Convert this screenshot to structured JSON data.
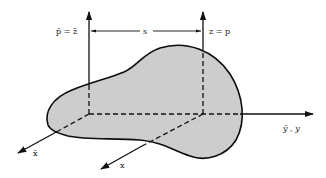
{
  "figure": {
    "colors": {
      "background": "#ffffff",
      "region_fill": "#c9c9c9",
      "line": "#111111"
    }
  },
  "labels": {
    "centroidal_vertical": "p̄ = z̄",
    "shifted_vertical": "z = p",
    "offset_distance": "s",
    "common_horizontal": "ȳ , y",
    "centroidal_depth": "x̄",
    "shifted_depth": "x"
  },
  "axes": [
    {
      "name": "p-bar/z-bar",
      "direction": "vertical",
      "origin": [
        89,
        114
      ],
      "tip": [
        89,
        12
      ]
    },
    {
      "name": "z/p",
      "direction": "vertical",
      "origin": [
        203,
        114
      ],
      "tip": [
        203,
        12
      ]
    },
    {
      "name": "y-bar/y",
      "direction": "horizontal",
      "origin": [
        89,
        114
      ],
      "tip": [
        313,
        114
      ]
    },
    {
      "name": "x-bar",
      "direction": "oblique",
      "origin": [
        89,
        114
      ],
      "tip": [
        18,
        153
      ]
    },
    {
      "name": "x",
      "direction": "oblique",
      "origin": [
        203,
        114
      ],
      "tip": [
        101,
        169
      ]
    }
  ]
}
